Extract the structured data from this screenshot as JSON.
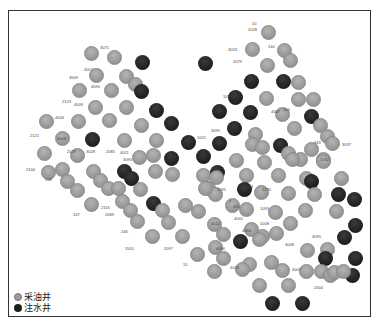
{
  "figure": {
    "type": "well-pattern-map",
    "legend": [
      {
        "key": "oil",
        "label": "采油井",
        "color": "#9c9c9c",
        "icon": "gray-circle-icon"
      },
      {
        "key": "water",
        "label": "注水井",
        "color": "#1e1e1e",
        "icon": "black-circle-icon"
      }
    ]
  },
  "wells": [
    {
      "x": 91,
      "y": 53,
      "t": "oil"
    },
    {
      "x": 114,
      "y": 57,
      "t": "oil"
    },
    {
      "x": 142,
      "y": 62,
      "t": "water"
    },
    {
      "x": 96,
      "y": 75,
      "t": "oil"
    },
    {
      "x": 126,
      "y": 76,
      "t": "oil"
    },
    {
      "x": 135,
      "y": 84,
      "t": "oil"
    },
    {
      "x": 141,
      "y": 91,
      "t": "water"
    },
    {
      "x": 79,
      "y": 90,
      "t": "oil"
    },
    {
      "x": 111,
      "y": 90,
      "t": "oil"
    },
    {
      "x": 95,
      "y": 107,
      "t": "oil"
    },
    {
      "x": 126,
      "y": 107,
      "t": "oil"
    },
    {
      "x": 156,
      "y": 110,
      "t": "water"
    },
    {
      "x": 109,
      "y": 120,
      "t": "oil"
    },
    {
      "x": 171,
      "y": 123,
      "t": "water"
    },
    {
      "x": 46,
      "y": 121,
      "t": "oil"
    },
    {
      "x": 78,
      "y": 121,
      "t": "oil"
    },
    {
      "x": 141,
      "y": 125,
      "t": "oil"
    },
    {
      "x": 62,
      "y": 138,
      "t": "oil"
    },
    {
      "x": 92,
      "y": 139,
      "t": "water"
    },
    {
      "x": 124,
      "y": 140,
      "t": "oil"
    },
    {
      "x": 156,
      "y": 140,
      "t": "oil"
    },
    {
      "x": 188,
      "y": 142,
      "t": "water"
    },
    {
      "x": 44,
      "y": 153,
      "t": "oil"
    },
    {
      "x": 77,
      "y": 155,
      "t": "oil"
    },
    {
      "x": 139,
      "y": 157,
      "t": "oil"
    },
    {
      "x": 153,
      "y": 155,
      "t": "oil"
    },
    {
      "x": 171,
      "y": 158,
      "t": "water"
    },
    {
      "x": 268,
      "y": 32,
      "t": "oil"
    },
    {
      "x": 252,
      "y": 49,
      "t": "oil"
    },
    {
      "x": 284,
      "y": 50,
      "t": "oil"
    },
    {
      "x": 290,
      "y": 60,
      "t": "oil"
    },
    {
      "x": 267,
      "y": 65,
      "t": "oil"
    },
    {
      "x": 205,
      "y": 63,
      "t": "water"
    },
    {
      "x": 251,
      "y": 81,
      "t": "water"
    },
    {
      "x": 283,
      "y": 81,
      "t": "water"
    },
    {
      "x": 298,
      "y": 82,
      "t": "oil"
    },
    {
      "x": 266,
      "y": 98,
      "t": "oil"
    },
    {
      "x": 298,
      "y": 99,
      "t": "oil"
    },
    {
      "x": 313,
      "y": 99,
      "t": "oil"
    },
    {
      "x": 235,
      "y": 97,
      "t": "water"
    },
    {
      "x": 219,
      "y": 111,
      "t": "water"
    },
    {
      "x": 250,
      "y": 112,
      "t": "water"
    },
    {
      "x": 282,
      "y": 114,
      "t": "oil"
    },
    {
      "x": 311,
      "y": 116,
      "t": "water"
    },
    {
      "x": 234,
      "y": 128,
      "t": "water"
    },
    {
      "x": 255,
      "y": 134,
      "t": "oil"
    },
    {
      "x": 294,
      "y": 128,
      "t": "oil"
    },
    {
      "x": 320,
      "y": 125,
      "t": "oil"
    },
    {
      "x": 327,
      "y": 136,
      "t": "oil"
    },
    {
      "x": 332,
      "y": 143,
      "t": "oil"
    },
    {
      "x": 219,
      "y": 143,
      "t": "water"
    },
    {
      "x": 252,
      "y": 144,
      "t": "oil"
    },
    {
      "x": 262,
      "y": 147,
      "t": "oil"
    },
    {
      "x": 280,
      "y": 145,
      "t": "water"
    },
    {
      "x": 311,
      "y": 149,
      "t": "oil"
    },
    {
      "x": 288,
      "y": 153,
      "t": "oil"
    },
    {
      "x": 300,
      "y": 159,
      "t": "oil"
    },
    {
      "x": 323,
      "y": 159,
      "t": "oil"
    },
    {
      "x": 203,
      "y": 156,
      "t": "water"
    },
    {
      "x": 236,
      "y": 160,
      "t": "oil"
    },
    {
      "x": 264,
      "y": 162,
      "t": "oil"
    },
    {
      "x": 292,
      "y": 159,
      "t": "oil"
    },
    {
      "x": 323,
      "y": 161,
      "t": "oil"
    },
    {
      "x": 48,
      "y": 172,
      "t": "oil"
    },
    {
      "x": 62,
      "y": 169,
      "t": "oil"
    },
    {
      "x": 67,
      "y": 181,
      "t": "oil"
    },
    {
      "x": 77,
      "y": 190,
      "t": "oil"
    },
    {
      "x": 93,
      "y": 171,
      "t": "oil"
    },
    {
      "x": 100,
      "y": 180,
      "t": "oil"
    },
    {
      "x": 108,
      "y": 188,
      "t": "oil"
    },
    {
      "x": 118,
      "y": 188,
      "t": "oil"
    },
    {
      "x": 124,
      "y": 171,
      "t": "water"
    },
    {
      "x": 131,
      "y": 178,
      "t": "water"
    },
    {
      "x": 140,
      "y": 189,
      "t": "oil"
    },
    {
      "x": 155,
      "y": 171,
      "t": "oil"
    },
    {
      "x": 172,
      "y": 174,
      "t": "oil"
    },
    {
      "x": 203,
      "y": 175,
      "t": "oil"
    },
    {
      "x": 217,
      "y": 172,
      "t": "water"
    },
    {
      "x": 91,
      "y": 204,
      "t": "oil"
    },
    {
      "x": 122,
      "y": 201,
      "t": "oil"
    },
    {
      "x": 130,
      "y": 210,
      "t": "oil"
    },
    {
      "x": 137,
      "y": 221,
      "t": "oil"
    },
    {
      "x": 153,
      "y": 203,
      "t": "water"
    },
    {
      "x": 162,
      "y": 210,
      "t": "oil"
    },
    {
      "x": 168,
      "y": 222,
      "t": "oil"
    },
    {
      "x": 152,
      "y": 236,
      "t": "oil"
    },
    {
      "x": 182,
      "y": 236,
      "t": "oil"
    },
    {
      "x": 185,
      "y": 205,
      "t": "oil"
    },
    {
      "x": 198,
      "y": 211,
      "t": "oil"
    },
    {
      "x": 208,
      "y": 188,
      "t": "oil"
    },
    {
      "x": 216,
      "y": 177,
      "t": "oil"
    },
    {
      "x": 246,
      "y": 175,
      "t": "oil"
    },
    {
      "x": 278,
      "y": 175,
      "t": "oil"
    },
    {
      "x": 306,
      "y": 178,
      "t": "oil"
    },
    {
      "x": 311,
      "y": 181,
      "t": "water"
    },
    {
      "x": 341,
      "y": 178,
      "t": "oil"
    },
    {
      "x": 215,
      "y": 194,
      "t": "oil"
    },
    {
      "x": 244,
      "y": 189,
      "t": "water"
    },
    {
      "x": 261,
      "y": 192,
      "t": "oil"
    },
    {
      "x": 288,
      "y": 193,
      "t": "oil"
    },
    {
      "x": 314,
      "y": 194,
      "t": "oil"
    },
    {
      "x": 338,
      "y": 194,
      "t": "water"
    },
    {
      "x": 205,
      "y": 188,
      "t": "oil"
    },
    {
      "x": 232,
      "y": 205,
      "t": "oil"
    },
    {
      "x": 246,
      "y": 209,
      "t": "oil"
    },
    {
      "x": 275,
      "y": 212,
      "t": "oil"
    },
    {
      "x": 305,
      "y": 210,
      "t": "oil"
    },
    {
      "x": 336,
      "y": 211,
      "t": "oil"
    },
    {
      "x": 214,
      "y": 224,
      "t": "oil"
    },
    {
      "x": 223,
      "y": 234,
      "t": "oil"
    },
    {
      "x": 251,
      "y": 229,
      "t": "oil"
    },
    {
      "x": 262,
      "y": 236,
      "t": "oil"
    },
    {
      "x": 276,
      "y": 233,
      "t": "oil"
    },
    {
      "x": 290,
      "y": 223,
      "t": "oil"
    },
    {
      "x": 215,
      "y": 247,
      "t": "oil"
    },
    {
      "x": 240,
      "y": 241,
      "t": "water"
    },
    {
      "x": 259,
      "y": 239,
      "t": "oil"
    },
    {
      "x": 307,
      "y": 250,
      "t": "oil"
    },
    {
      "x": 327,
      "y": 249,
      "t": "oil"
    },
    {
      "x": 344,
      "y": 237,
      "t": "water"
    },
    {
      "x": 355,
      "y": 225,
      "t": "water"
    },
    {
      "x": 197,
      "y": 254,
      "t": "oil"
    },
    {
      "x": 223,
      "y": 258,
      "t": "oil"
    },
    {
      "x": 249,
      "y": 264,
      "t": "oil"
    },
    {
      "x": 282,
      "y": 270,
      "t": "oil"
    },
    {
      "x": 325,
      "y": 258,
      "t": "water"
    },
    {
      "x": 321,
      "y": 271,
      "t": "oil"
    },
    {
      "x": 330,
      "y": 275,
      "t": "oil"
    },
    {
      "x": 352,
      "y": 275,
      "t": "water"
    },
    {
      "x": 214,
      "y": 271,
      "t": "oil"
    },
    {
      "x": 242,
      "y": 269,
      "t": "oil"
    },
    {
      "x": 271,
      "y": 262,
      "t": "oil"
    },
    {
      "x": 306,
      "y": 271,
      "t": "oil"
    },
    {
      "x": 334,
      "y": 272,
      "t": "oil"
    },
    {
      "x": 343,
      "y": 271,
      "t": "oil"
    },
    {
      "x": 259,
      "y": 285,
      "t": "oil"
    },
    {
      "x": 288,
      "y": 285,
      "t": "oil"
    },
    {
      "x": 272,
      "y": 303,
      "t": "water"
    },
    {
      "x": 302,
      "y": 303,
      "t": "water"
    },
    {
      "x": 355,
      "y": 258,
      "t": "water"
    },
    {
      "x": 354,
      "y": 199,
      "t": "water"
    }
  ],
  "labels": [
    {
      "x": 100,
      "y": 46,
      "text": "3071"
    },
    {
      "x": 84,
      "y": 68,
      "text": "4007"
    },
    {
      "x": 69,
      "y": 76,
      "text": "3009"
    },
    {
      "x": 91,
      "y": 85,
      "text": "4090"
    },
    {
      "x": 62,
      "y": 100,
      "text": "2123"
    },
    {
      "x": 74,
      "y": 103,
      "text": "4009"
    },
    {
      "x": 55,
      "y": 116,
      "text": "4006"
    },
    {
      "x": 30,
      "y": 134,
      "text": "2121"
    },
    {
      "x": 57,
      "y": 137,
      "text": "4006"
    },
    {
      "x": 67,
      "y": 150,
      "text": "2029"
    },
    {
      "x": 86,
      "y": 150,
      "text": "3028"
    },
    {
      "x": 106,
      "y": 150,
      "text": "2085"
    },
    {
      "x": 120,
      "y": 151,
      "text": "4011"
    },
    {
      "x": 123,
      "y": 158,
      "text": "3090"
    },
    {
      "x": 26,
      "y": 168,
      "text": "2104"
    },
    {
      "x": 45,
      "y": 178,
      "text": "248"
    },
    {
      "x": 73,
      "y": 213,
      "text": "247"
    },
    {
      "x": 101,
      "y": 206,
      "text": "2116"
    },
    {
      "x": 105,
      "y": 213,
      "text": "2089"
    },
    {
      "x": 121,
      "y": 230,
      "text": "246"
    },
    {
      "x": 125,
      "y": 247,
      "text": "5505"
    },
    {
      "x": 164,
      "y": 247,
      "text": "2097"
    },
    {
      "x": 183,
      "y": 263,
      "text": "15"
    },
    {
      "x": 252,
      "y": 22,
      "text": "10"
    },
    {
      "x": 248,
      "y": 28,
      "text": "1028"
    },
    {
      "x": 228,
      "y": 48,
      "text": "3024"
    },
    {
      "x": 233,
      "y": 60,
      "text": "2079"
    },
    {
      "x": 268,
      "y": 45,
      "text": "140"
    },
    {
      "x": 223,
      "y": 95,
      "text": "101"
    },
    {
      "x": 283,
      "y": 108,
      "text": "104"
    },
    {
      "x": 211,
      "y": 129,
      "text": "3095"
    },
    {
      "x": 197,
      "y": 136,
      "text": "1021"
    },
    {
      "x": 271,
      "y": 110,
      "text": "4007"
    },
    {
      "x": 314,
      "y": 141,
      "text": "343"
    },
    {
      "x": 342,
      "y": 143,
      "text": "3037"
    },
    {
      "x": 320,
      "y": 158,
      "text": "1012"
    },
    {
      "x": 217,
      "y": 188,
      "text": "1095"
    },
    {
      "x": 244,
      "y": 185,
      "text": "1094"
    },
    {
      "x": 262,
      "y": 188,
      "text": "1270"
    },
    {
      "x": 229,
      "y": 200,
      "text": "7"
    },
    {
      "x": 233,
      "y": 205,
      "text": "321"
    },
    {
      "x": 260,
      "y": 207,
      "text": "1093"
    },
    {
      "x": 234,
      "y": 217,
      "text": "4005"
    },
    {
      "x": 260,
      "y": 222,
      "text": "1008"
    },
    {
      "x": 211,
      "y": 222,
      "text": "4012"
    },
    {
      "x": 242,
      "y": 229,
      "text": "4004"
    },
    {
      "x": 216,
      "y": 247,
      "text": "4006"
    },
    {
      "x": 230,
      "y": 266,
      "text": "4024"
    },
    {
      "x": 285,
      "y": 243,
      "text": "4008"
    },
    {
      "x": 312,
      "y": 235,
      "text": "3095"
    },
    {
      "x": 292,
      "y": 268,
      "text": "4007"
    },
    {
      "x": 314,
      "y": 286,
      "text": "2004"
    }
  ]
}
